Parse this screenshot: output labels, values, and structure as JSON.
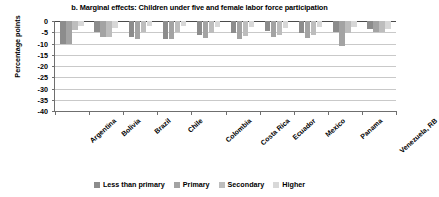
{
  "chart_data": {
    "type": "bar",
    "title": "b. Marginal effects: Children under five and female labor force participation",
    "xlabel": "",
    "ylabel": "Percentage points",
    "ylim": [
      -40,
      0
    ],
    "yticks": [
      0,
      -5,
      -10,
      -15,
      -20,
      -25,
      -30,
      -35,
      -40
    ],
    "grid": true,
    "legend_position": "bottom",
    "categories": [
      "Argentina",
      "Bolivia",
      "Brazil",
      "Chile",
      "Colombia",
      "Costa Rica",
      "Ecuador",
      "Mexico",
      "Panama",
      "Venezuela, RB"
    ],
    "series": [
      {
        "name": "Less than primary",
        "color": "#8c8c8c",
        "values": [
          -10.0,
          -5.0,
          -7.0,
          -8.0,
          -6.0,
          -5.5,
          -4.5,
          -5.5,
          -5.0,
          -3.5
        ]
      },
      {
        "name": "Primary",
        "color": "#a3a3a3",
        "values": [
          -10.0,
          -7.0,
          -8.0,
          -8.0,
          -7.5,
          -8.0,
          -7.0,
          -7.5,
          -11.0,
          -5.0
        ]
      },
      {
        "name": "Secondary",
        "color": "#bdbdbd",
        "values": [
          -4.0,
          -7.0,
          -5.0,
          -5.0,
          -5.5,
          -6.5,
          -6.0,
          -6.0,
          -5.5,
          -5.0
        ]
      },
      {
        "name": "Higher",
        "color": "#d8d8d8",
        "values": [
          -2.0,
          -3.0,
          -2.0,
          -2.0,
          -2.5,
          -2.5,
          -3.0,
          -2.5,
          -2.5,
          -3.5
        ]
      }
    ]
  }
}
